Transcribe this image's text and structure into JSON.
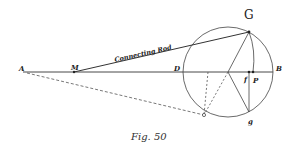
{
  "figure": {
    "caption": "Fig. 50",
    "title_label": "G",
    "rod_label": "Connecting Rod",
    "points": {
      "A": "A",
      "M": "M",
      "D": "D",
      "B": "B",
      "f": "f",
      "P": "P",
      "g": "g"
    },
    "colors": {
      "ink": "#222222",
      "background": "#ffffff"
    }
  }
}
